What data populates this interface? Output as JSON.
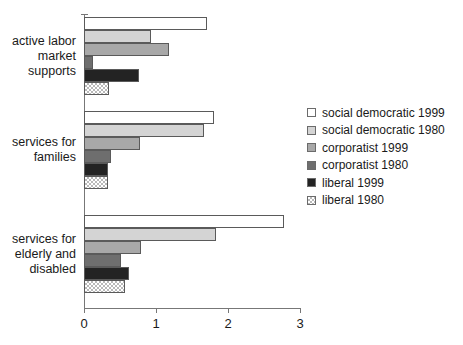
{
  "chart_data": {
    "type": "bar",
    "orientation": "horizontal",
    "title": "",
    "subtitle": "",
    "xlabel": "",
    "ylabel": "",
    "xlim": [
      0,
      3
    ],
    "xticks": [
      0,
      1,
      2,
      3
    ],
    "xtick_labels": [
      "0",
      "1",
      "2",
      "3"
    ],
    "grid": false,
    "legend_position": "right",
    "categories": [
      "active labor market supports",
      "services for families",
      "services for elderly and disabled"
    ],
    "category_labels": [
      [
        "active labor",
        "market",
        "supports"
      ],
      [
        "services for",
        "families"
      ],
      [
        "services for",
        "elderly and",
        "disabled"
      ]
    ],
    "series": [
      {
        "name": "social democratic 1999",
        "swatch": "white",
        "color": "#ffffff",
        "values": [
          1.71,
          1.81,
          2.78
        ]
      },
      {
        "name": "social democratic 1980",
        "swatch": "lightgray",
        "color": "#d4d4d4",
        "values": [
          0.93,
          1.67,
          1.83
        ]
      },
      {
        "name": "corporatist 1999",
        "swatch": "midgray",
        "color": "#a8a8a8",
        "values": [
          1.18,
          0.78,
          0.79
        ]
      },
      {
        "name": "corporatist 1980",
        "swatch": "darkgray",
        "color": "#6e6e6e",
        "values": [
          0.13,
          0.38,
          0.51
        ]
      },
      {
        "name": "liberal 1999",
        "swatch": "black",
        "color": "#232323",
        "values": [
          0.76,
          0.33,
          0.63
        ]
      },
      {
        "name": "liberal 1980",
        "swatch": "dotted",
        "color": "#ffffff",
        "values": [
          0.35,
          0.33,
          0.57
        ]
      }
    ]
  },
  "legend": {
    "items": [
      {
        "label": "social democratic 1999"
      },
      {
        "label": "social democratic 1980"
      },
      {
        "label": "corporatist 1999"
      },
      {
        "label": "corporatist 1980"
      },
      {
        "label": "liberal 1999"
      },
      {
        "label": "liberal 1980"
      }
    ]
  },
  "axis": {
    "tick_labels": [
      "0",
      "1",
      "2",
      "3"
    ]
  }
}
